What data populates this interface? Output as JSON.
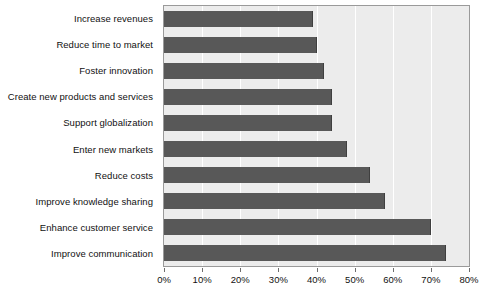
{
  "chart_data": {
    "type": "bar",
    "orientation": "horizontal",
    "title": "",
    "xlabel": "",
    "ylabel": "",
    "xlim": [
      0,
      80
    ],
    "xtick_labels": [
      "0%",
      "10%",
      "20%",
      "30%",
      "40%",
      "50%",
      "60%",
      "70%",
      "80%"
    ],
    "xtick_values": [
      0,
      10,
      20,
      30,
      40,
      50,
      60,
      70,
      80
    ],
    "grid": true,
    "legend": "none",
    "categories": [
      "Increase revenues",
      "Reduce time to market",
      "Foster innovation",
      "Create new products and services",
      "Support globalization",
      "Enter new markets",
      "Reduce costs",
      "Improve knowledge sharing",
      "Enhance customer service",
      "Improve communication"
    ],
    "values": [
      39,
      40,
      42,
      44,
      44,
      48,
      54,
      58,
      70,
      74
    ],
    "colors": {
      "bar": "#585858",
      "plot_background": "#ececec",
      "gridline": "#ffffff",
      "axis": "#9a9a9a",
      "text": "#111111",
      "page_background": "#ffffff"
    }
  }
}
